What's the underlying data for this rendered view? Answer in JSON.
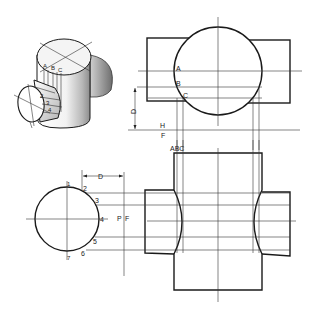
{
  "figure": {
    "type": "orthographic projection with isometric view",
    "colors": {
      "line": "#1a1a1a",
      "background": "#ffffff",
      "shade": "#9a9a9a"
    }
  },
  "isometric_view": {
    "labels": {
      "a": "A",
      "b": "B",
      "c": "C",
      "n2": "2",
      "n3": "3",
      "n4": "4"
    }
  },
  "top_view": {
    "labels": {
      "a": "A",
      "b": "B",
      "c": "C",
      "dim": "D",
      "h": "H",
      "f": "F"
    }
  },
  "front_view": {
    "labels": {
      "abc": "ABC"
    }
  },
  "side_view": {
    "labels": {
      "n1": "1",
      "n2": "2",
      "n3": "3",
      "n4": "4",
      "n5": "5",
      "n6": "6",
      "n7": "7",
      "dim": "D",
      "p": "P",
      "f": "F"
    }
  }
}
